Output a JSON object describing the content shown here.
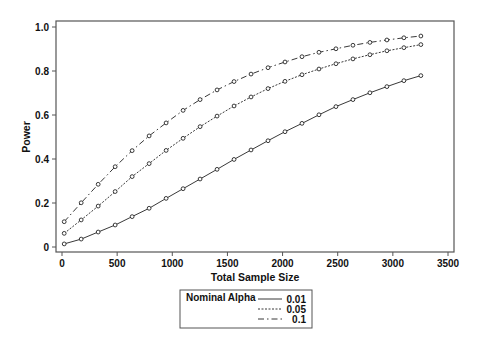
{
  "chart_data": {
    "type": "line",
    "title": "",
    "xlabel": "Total Sample Size",
    "ylabel": "Power",
    "xlim": [
      0,
      3500
    ],
    "ylim": [
      0,
      1.0
    ],
    "x_ticks": [
      0,
      500,
      1000,
      1500,
      2000,
      2500,
      3000,
      3500
    ],
    "y_ticks": [
      0,
      0.2,
      0.4,
      0.6,
      0.8,
      1.0
    ],
    "y_tick_labels": [
      "0",
      "0.2",
      "0.4",
      "0.6",
      "0.8",
      "1.0"
    ],
    "grid": false,
    "markers": "circle",
    "legend_title": "Nominal Alpha",
    "legend_position": "bottom",
    "x": [
      20,
      174,
      328,
      482,
      636,
      790,
      944,
      1098,
      1252,
      1406,
      1560,
      1714,
      1868,
      2022,
      2176,
      2330,
      2484,
      2638,
      2792,
      2946,
      3100,
      3254
    ],
    "series": [
      {
        "name": "0.01",
        "line_style": "solid",
        "values": [
          0.014,
          0.036,
          0.068,
          0.1,
          0.138,
          0.176,
          0.221,
          0.265,
          0.309,
          0.353,
          0.398,
          0.441,
          0.483,
          0.524,
          0.562,
          0.601,
          0.638,
          0.67,
          0.701,
          0.729,
          0.756,
          0.779
        ]
      },
      {
        "name": "0.05",
        "line_style": "dotted",
        "values": [
          0.062,
          0.123,
          0.186,
          0.252,
          0.32,
          0.379,
          0.439,
          0.494,
          0.547,
          0.595,
          0.641,
          0.682,
          0.72,
          0.753,
          0.783,
          0.809,
          0.833,
          0.855,
          0.874,
          0.892,
          0.906,
          0.92
        ]
      },
      {
        "name": "0.1",
        "line_style": "dash-dot",
        "values": [
          0.115,
          0.201,
          0.285,
          0.365,
          0.438,
          0.505,
          0.564,
          0.621,
          0.67,
          0.714,
          0.752,
          0.786,
          0.815,
          0.841,
          0.865,
          0.885,
          0.901,
          0.917,
          0.93,
          0.941,
          0.951,
          0.959
        ]
      }
    ]
  },
  "legend": {
    "title": "Nominal Alpha",
    "entries": [
      {
        "label": "0.01",
        "style": "solid"
      },
      {
        "label": "0.05",
        "style": "dotted"
      },
      {
        "label": "0.1",
        "style": "dash-dot"
      }
    ]
  },
  "colors": {
    "line": "#222222",
    "frame": "#555555",
    "marker_fill": "#ffffff"
  }
}
